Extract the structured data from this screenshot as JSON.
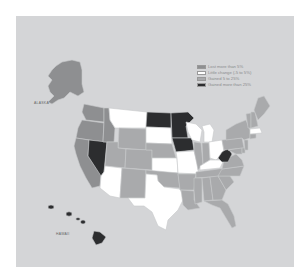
{
  "map": {
    "legend": {
      "title": "",
      "items": [
        {
          "key": "lost",
          "label": "Lost more than 5%",
          "color": "#8e8f91"
        },
        {
          "key": "little",
          "label": "Little change (-5 to 5%)",
          "color": "#ffffff"
        },
        {
          "key": "gain",
          "label": "Gained 5 to 25%",
          "color": "#a9aaac"
        },
        {
          "key": "gain_big",
          "label": "Gained more than 25%",
          "color": "#2c2d2f"
        }
      ]
    },
    "labels": {
      "alaska": "ALASKA",
      "hawaii": "HAWAII"
    },
    "states": {
      "WA": "lost",
      "OR": "lost",
      "CA": "lost",
      "NV": "gain_big",
      "ID": "lost",
      "MT": "little",
      "WY": "gain",
      "UT": "gain",
      "CO": "gain",
      "AZ": "little",
      "NM": "gain",
      "ND": "gain_big",
      "SD": "little",
      "NE": "gain",
      "KS": "little",
      "OK": "gain",
      "TX": "little",
      "MN": "gain_big",
      "IA": "gain_big",
      "MO": "little",
      "AR": "gain",
      "LA": "gain",
      "WI": "little",
      "IL": "gain",
      "MI": "little",
      "IN": "gain",
      "OH": "little",
      "KY": "little",
      "TN": "gain",
      "MS": "gain",
      "AL": "gain",
      "GA": "gain",
      "FL": "gain",
      "SC": "gain",
      "NC": "gain",
      "VA": "gain",
      "WV": "gain_big",
      "PA": "gain",
      "NY": "gain",
      "VT": "gain",
      "NH": "gain",
      "ME": "gain",
      "MA": "little",
      "CT": "gain",
      "NJ": "gain",
      "MD": "gain",
      "DE": "gain",
      "AK": "lost",
      "HI": "gain_big"
    }
  }
}
